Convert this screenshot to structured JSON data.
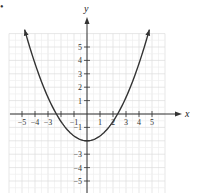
{
  "bullet": "•",
  "chart_data": {
    "type": "line",
    "title": "",
    "xlabel": "x",
    "ylabel": "y",
    "xlim": [
      -6,
      6
    ],
    "ylim": [
      -6,
      6
    ],
    "grid": true,
    "x_ticks": [
      -5,
      -4,
      -3,
      -2,
      -1,
      1,
      2,
      3,
      4,
      5
    ],
    "x_tick_labels": [
      "−5",
      "−4",
      "−3",
      "",
      "−1",
      "1",
      "2",
      "3",
      "4",
      "5"
    ],
    "y_ticks": [
      5,
      4,
      3,
      2,
      1,
      -1,
      -2,
      -3,
      -4,
      -5
    ],
    "y_tick_labels": [
      "5",
      "4",
      "3",
      "2",
      "1",
      "−1",
      "",
      "−3",
      "−4",
      "−5"
    ],
    "series": [
      {
        "name": "parabola",
        "equation_estimate": "y = 0.36x² − 2",
        "vertex": [
          0,
          -2
        ],
        "x_intercepts": [
          -2.35,
          2.35
        ],
        "x": [
          -4.8,
          -4,
          -3,
          -2,
          -1,
          0,
          1,
          2,
          3,
          4,
          4.8
        ],
        "y": [
          6.3,
          3.76,
          1.24,
          -0.56,
          -1.64,
          -2,
          -1.64,
          -0.56,
          1.24,
          3.76,
          6.3
        ],
        "arrows_at_ends": true
      }
    ],
    "color": "#333333"
  }
}
